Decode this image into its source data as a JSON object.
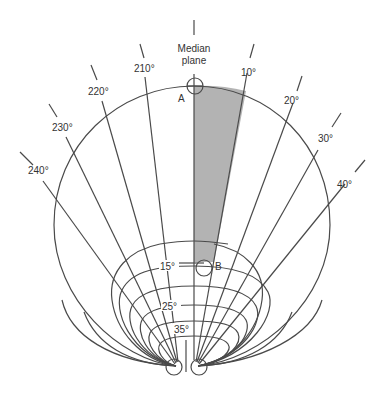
{
  "diagram": {
    "median_label_line1": "Median",
    "median_label_line2": "plane",
    "point_a": "A",
    "point_b": "B",
    "right_angles": [
      "10°",
      "20°",
      "30°",
      "40°"
    ],
    "left_angles": [
      "210°",
      "220°",
      "230°",
      "240°"
    ],
    "inner_labels": [
      "15°",
      "25°",
      "35°"
    ],
    "shaded_region_color": "#b0b0b0",
    "line_color": "#4a4a4a"
  }
}
